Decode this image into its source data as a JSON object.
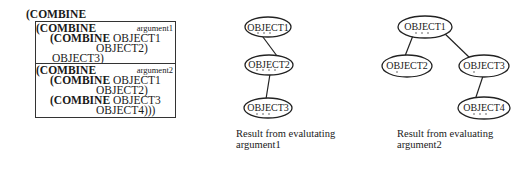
{
  "expression": {
    "outer_open": "(COMBINE",
    "argument1": {
      "tag": "argument1",
      "lines": [
        {
          "kw": "(COMBINE",
          "rest": ""
        },
        {
          "kw": "(COMBINE",
          "rest": " OBJECT1"
        },
        {
          "kw": "",
          "rest": "OBJECT2)"
        },
        {
          "kw": "",
          "rest": "OBJECT3)"
        }
      ]
    },
    "argument2": {
      "tag": "argument2",
      "lines": [
        {
          "kw": "(COMBINE",
          "rest": ""
        },
        {
          "kw": "(COMBINE",
          "rest": " OBJECT1"
        },
        {
          "kw": "",
          "rest": "OBJECT2)"
        },
        {
          "kw": "(COMBINE",
          "rest": " OBJECT3"
        },
        {
          "kw": "",
          "rest": "OBJECT4)))"
        }
      ]
    }
  },
  "tree1": {
    "nodes": [
      {
        "id": "n1",
        "label": "OBJECT1"
      },
      {
        "id": "n2",
        "label": "OBJECT2"
      },
      {
        "id": "n3",
        "label": "OBJECT3"
      }
    ],
    "caption_line1": "Result from evalutating",
    "caption_line2": "argument1"
  },
  "tree2": {
    "nodes": [
      {
        "id": "m1",
        "label": "OBJECT1"
      },
      {
        "id": "m2",
        "label": "OBJECT2"
      },
      {
        "id": "m3",
        "label": "OBJECT3"
      },
      {
        "id": "m4",
        "label": "OBJECT4"
      }
    ],
    "caption_line1": "Result from evaluating",
    "caption_line2": "argument2"
  }
}
